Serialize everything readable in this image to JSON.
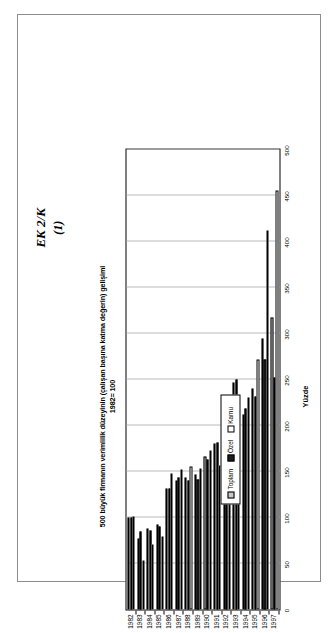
{
  "page": {
    "header_line1": "EK 2/K",
    "header_line2": "(1)"
  },
  "legend": {
    "items": [
      {
        "label": "Toplam",
        "color": "#b3b3b3",
        "pattern": "hatched"
      },
      {
        "label": "Özel",
        "color": "#1c1c1c",
        "pattern": "solid-dark"
      },
      {
        "label": "Kamu",
        "color": "#ffffff",
        "pattern": "white"
      }
    ],
    "position": "left-center"
  },
  "chart_data": {
    "type": "bar",
    "orientation": "horizontal",
    "title": "500 büyük firmanın verimlilik düzeyinin (çalışan başına katma değerin) gelişimi 1982= 100",
    "title_line1": "500 büyük firmanın verimlilik düzeyinin (çalışan başına katma değerin) gelişimi",
    "title_line2": "1982= 100",
    "xlabel": "",
    "ylabel": "Yüzde",
    "value_axis_name": "Yüzde",
    "ylim": [
      0,
      500
    ],
    "tick_labels": [
      "0",
      "50",
      "100",
      "150",
      "200",
      "250",
      "300",
      "350",
      "400",
      "450",
      "500"
    ],
    "ticks": [
      0,
      50,
      100,
      150,
      200,
      250,
      300,
      350,
      400,
      450,
      500
    ],
    "grid": true,
    "categories": [
      "1982",
      "1983",
      "1984",
      "1985",
      "1986",
      "1987",
      "1988",
      "1989",
      "1990",
      "1991",
      "1992",
      "1993",
      "1994",
      "1995",
      "1996",
      "1997"
    ],
    "series": [
      {
        "name": "Toplam",
        "values": [
          100,
          77,
          88,
          92,
          131,
          140,
          143,
          147,
          166,
          180,
          209,
          247,
          212,
          240,
          295,
          317
        ]
      },
      {
        "name": "Özel",
        "values": [
          100,
          85,
          86,
          90,
          132,
          143,
          140,
          141,
          163,
          182,
          212,
          250,
          219,
          231,
          272,
          252
        ]
      },
      {
        "name": "Kamu",
        "values": [
          101,
          53,
          71,
          79,
          148,
          152,
          155,
          153,
          173,
          157,
          221,
          228,
          230,
          272,
          412,
          455
        ]
      }
    ]
  }
}
